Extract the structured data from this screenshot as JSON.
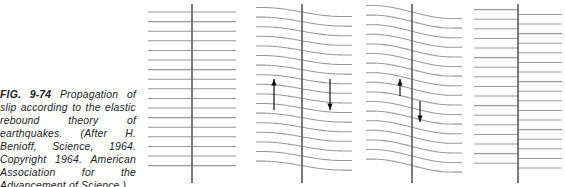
{
  "figure": {
    "label": "FIG. 9-74",
    "caption_text": "Propagation of slip according to the elastic rebound theory of earthquakes. (After H. Benioff, Science, 1964. Copyright 1964. American Association for the Advancement of Science.)",
    "caption_full": "FIG. 9-74 Propagation of slip according to the elastic rebound theory of earthquakes. (After H. Benioff, Science, 1964. Copyright 1964. American Association for the Advancement of Science.)"
  },
  "colors": {
    "strata": "#9a9a9a",
    "fault": "#5a5a5a",
    "arrow": "#111111",
    "background": "#ffffff",
    "text": "#1b1b1b"
  },
  "chart_data": {
    "type": "diagram",
    "title": "Propagation of slip according to the elastic rebound theory of earthquakes",
    "diagram_kind": "strike-slip fault elastic rebound sequence",
    "panel_count": 4,
    "strata_line_count": 17,
    "strata_top_y": 12,
    "strata_spacing_y": 9.6,
    "panels": [
      {
        "index": 1,
        "stage": "undeformed",
        "left": 140,
        "width": 104,
        "plot_left": 8,
        "plot_right": 96,
        "fault_x": 52,
        "fault_top": 4,
        "fault_bottom": 183,
        "bend_amplitude": 0,
        "bend_halfwidth": 0,
        "offset": 0,
        "arrows": []
      },
      {
        "index": 2,
        "stage": "strain-accumulating",
        "left": 252,
        "width": 104,
        "plot_left": 4,
        "plot_right": 100,
        "fault_x": 50,
        "fault_top": 4,
        "fault_bottom": 183,
        "bend_amplitude": 9.0,
        "bend_halfwidth": 40,
        "offset": 0,
        "arrows": [
          {
            "name": "left-shear-arrow",
            "direction": "up",
            "x": 22,
            "y_tail": 110,
            "y_head": 79
          },
          {
            "name": "right-shear-arrow",
            "direction": "down",
            "x": 78,
            "y_tail": 79,
            "y_head": 110
          }
        ]
      },
      {
        "index": 3,
        "stage": "strain-maximum",
        "left": 362,
        "width": 104,
        "plot_left": 4,
        "plot_right": 100,
        "fault_x": 50,
        "fault_top": 4,
        "fault_bottom": 183,
        "bend_amplitude": 13.0,
        "bend_halfwidth": 40,
        "offset": 0,
        "arrows": [
          {
            "name": "left-shear-arrow",
            "direction": "up",
            "x": 38,
            "y_tail": 96,
            "y_head": 79
          },
          {
            "name": "right-shear-arrow",
            "direction": "down",
            "x": 58,
            "y_tail": 101,
            "y_head": 122
          }
        ]
      },
      {
        "index": 4,
        "stage": "ruptured-offset",
        "left": 470,
        "width": 95,
        "plot_left": 4,
        "plot_right": 92,
        "fault_x": 48,
        "fault_top": 4,
        "fault_bottom": 183,
        "bend_amplitude": 0,
        "bend_halfwidth": 0,
        "offset": 4.8,
        "arrows": []
      }
    ]
  }
}
